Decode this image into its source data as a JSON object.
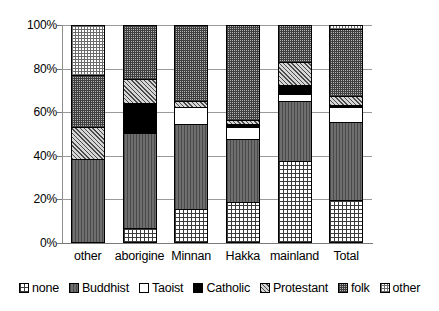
{
  "chart_data": {
    "type": "bar",
    "subtype": "stacked-percent",
    "title": "",
    "xlabel": "",
    "ylabel": "",
    "ylim": [
      0,
      100
    ],
    "ytick_labels": [
      "0%",
      "20%",
      "40%",
      "60%",
      "80%",
      "100%"
    ],
    "ytick_values": [
      0,
      20,
      40,
      60,
      80,
      100
    ],
    "grid": true,
    "legend_position": "bottom",
    "categories": [
      "other",
      "aborigine",
      "Minnan",
      "Hakka",
      "mainland",
      "Total"
    ],
    "series": [
      {
        "name": "none",
        "values": [
          0,
          6,
          15,
          18,
          37,
          19
        ]
      },
      {
        "name": "Buddhist",
        "values": [
          38,
          44,
          39,
          29,
          28,
          36
        ]
      },
      {
        "name": "Taoist",
        "values": [
          0,
          0,
          8,
          6,
          3,
          7
        ]
      },
      {
        "name": "Catholic",
        "values": [
          0,
          14,
          0,
          1,
          4,
          1
        ]
      },
      {
        "name": "Protestant",
        "values": [
          15,
          11,
          3,
          2,
          11,
          4
        ]
      },
      {
        "name": "folk",
        "values": [
          24,
          25,
          35,
          44,
          17,
          31
        ]
      },
      {
        "name": "other",
        "values": [
          23,
          0,
          0,
          0,
          0,
          2
        ]
      }
    ],
    "legend": [
      {
        "label": "none",
        "pattern": "grid-medium"
      },
      {
        "label": "Buddhist",
        "pattern": "vertical-dark-gray"
      },
      {
        "label": "Taoist",
        "pattern": "solid-white"
      },
      {
        "label": "Catholic",
        "pattern": "solid-black"
      },
      {
        "label": "Protestant",
        "pattern": "diagonal-hatch"
      },
      {
        "label": "folk",
        "pattern": "dense-grid"
      },
      {
        "label": "other",
        "pattern": "light-grid"
      }
    ]
  }
}
